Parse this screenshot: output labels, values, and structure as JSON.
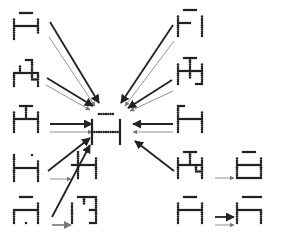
{
  "diagram": {
    "title": "",
    "colors": {
      "dot": "#222222",
      "arrow_thick": "#222222",
      "arrow_thin": "#777777",
      "background": "#ffffff"
    },
    "center_glyph": {
      "id": "A-center",
      "x": 90,
      "y": 108
    },
    "glyphs": [
      {
        "id": "L1",
        "x": 14,
        "y": 13,
        "pattern": [
          "01110",
          "10001",
          "11111",
          "10001",
          "10000"
        ],
        "col": "left"
      },
      {
        "id": "L2",
        "x": 14,
        "y": 60,
        "pattern": [
          "00110",
          "01010",
          "11111",
          "10011",
          "10001"
        ],
        "col": "left"
      },
      {
        "id": "L3",
        "x": 14,
        "y": 106,
        "pattern": [
          "01110",
          "10101",
          "11111",
          "10001",
          "10001"
        ],
        "col": "left"
      },
      {
        "id": "L4",
        "x": 14,
        "y": 155,
        "pattern": [
          "10010",
          "10001",
          "11111",
          "10001",
          "10001"
        ],
        "col": "left"
      },
      {
        "id": "L5",
        "x": 14,
        "y": 197,
        "pattern": [
          "01110",
          "00001",
          "11111",
          "10001",
          "10101"
        ],
        "col": "left"
      },
      {
        "id": "M4",
        "x": 72,
        "y": 152,
        "pattern": [
          "01000",
          "01001",
          "11111",
          "01001",
          "01001"
        ],
        "col": "mid"
      },
      {
        "id": "M5",
        "x": 72,
        "y": 197,
        "pattern": [
          "01111",
          "10101",
          "10011",
          "10001",
          "10011"
        ],
        "col": "mid"
      },
      {
        "id": "R1",
        "x": 178,
        "y": 10,
        "pattern": [
          "01110",
          "10001",
          "11101",
          "10001",
          "10001"
        ],
        "col": "right"
      },
      {
        "id": "R2",
        "x": 178,
        "y": 58,
        "pattern": [
          "01110",
          "10101",
          "11111",
          "10101",
          "10011"
        ],
        "col": "right"
      },
      {
        "id": "R3",
        "x": 178,
        "y": 106,
        "pattern": [
          "11000",
          "10001",
          "11111",
          "10001",
          "10001"
        ],
        "col": "right"
      },
      {
        "id": "R4",
        "x": 178,
        "y": 152,
        "pattern": [
          "01110",
          "10101",
          "11111",
          "10011",
          "10001"
        ],
        "col": "right"
      },
      {
        "id": "R5",
        "x": 178,
        "y": 197,
        "pattern": [
          "01110",
          "10001",
          "11111",
          "10001",
          "10001"
        ],
        "col": "right"
      },
      {
        "id": "RR4",
        "x": 237,
        "y": 152,
        "pattern": [
          "01110",
          "10001",
          "11111",
          "10001",
          "11111"
        ],
        "col": "far-right"
      },
      {
        "id": "RR5",
        "x": 237,
        "y": 197,
        "pattern": [
          "01111",
          "10000",
          "11111",
          "10001",
          "10001"
        ],
        "col": "far-right"
      }
    ],
    "arrows": [
      {
        "from": "L1",
        "x1": 50,
        "y1": 22,
        "x2": 99,
        "y2": 103,
        "weight": "thick"
      },
      {
        "from": "L1",
        "x1": 49,
        "y1": 37,
        "x2": 95,
        "y2": 106,
        "weight": "thin"
      },
      {
        "from": "L2",
        "x1": 47,
        "y1": 78,
        "x2": 93,
        "y2": 106,
        "weight": "thick"
      },
      {
        "from": "L2",
        "x1": 46,
        "y1": 85,
        "x2": 90,
        "y2": 110,
        "weight": "thin"
      },
      {
        "from": "L3",
        "x1": 50,
        "y1": 124,
        "x2": 92,
        "y2": 124,
        "weight": "thick"
      },
      {
        "from": "L3",
        "x1": 50,
        "y1": 132,
        "x2": 92,
        "y2": 132,
        "weight": "thin"
      },
      {
        "from": "L4",
        "x1": 48,
        "y1": 171,
        "x2": 90,
        "y2": 138,
        "weight": "thick"
      },
      {
        "from": "L5",
        "x1": 52,
        "y1": 217,
        "x2": 90,
        "y2": 145,
        "weight": "thick"
      },
      {
        "from": "L4-M4",
        "x1": 50,
        "y1": 179,
        "x2": 71,
        "y2": 179,
        "weight": "thin"
      },
      {
        "from": "L5-M5",
        "x1": 52,
        "y1": 225,
        "x2": 71,
        "y2": 225,
        "weight": "medium"
      },
      {
        "from": "R1",
        "x1": 173,
        "y1": 25,
        "x2": 121,
        "y2": 103,
        "weight": "thick"
      },
      {
        "from": "R1",
        "x1": 174,
        "y1": 41,
        "x2": 125,
        "y2": 106,
        "weight": "thin"
      },
      {
        "from": "R2",
        "x1": 172,
        "y1": 80,
        "x2": 128,
        "y2": 108,
        "weight": "thick"
      },
      {
        "from": "R2",
        "x1": 173,
        "y1": 91,
        "x2": 130,
        "y2": 111,
        "weight": "thin"
      },
      {
        "from": "R3",
        "x1": 173,
        "y1": 124,
        "x2": 133,
        "y2": 124,
        "weight": "thick"
      },
      {
        "from": "R3",
        "x1": 173,
        "y1": 132,
        "x2": 133,
        "y2": 132,
        "weight": "thin"
      },
      {
        "from": "R4",
        "x1": 174,
        "y1": 171,
        "x2": 135,
        "y2": 141,
        "weight": "thick"
      },
      {
        "from": "R4-RR4",
        "x1": 215,
        "y1": 178,
        "x2": 234,
        "y2": 178,
        "weight": "thin"
      },
      {
        "from": "R5-RR5",
        "x1": 215,
        "y1": 217,
        "x2": 234,
        "y2": 217,
        "weight": "thick"
      },
      {
        "from": "R5-RR5",
        "x1": 215,
        "y1": 225,
        "x2": 234,
        "y2": 225,
        "weight": "thin"
      }
    ]
  }
}
